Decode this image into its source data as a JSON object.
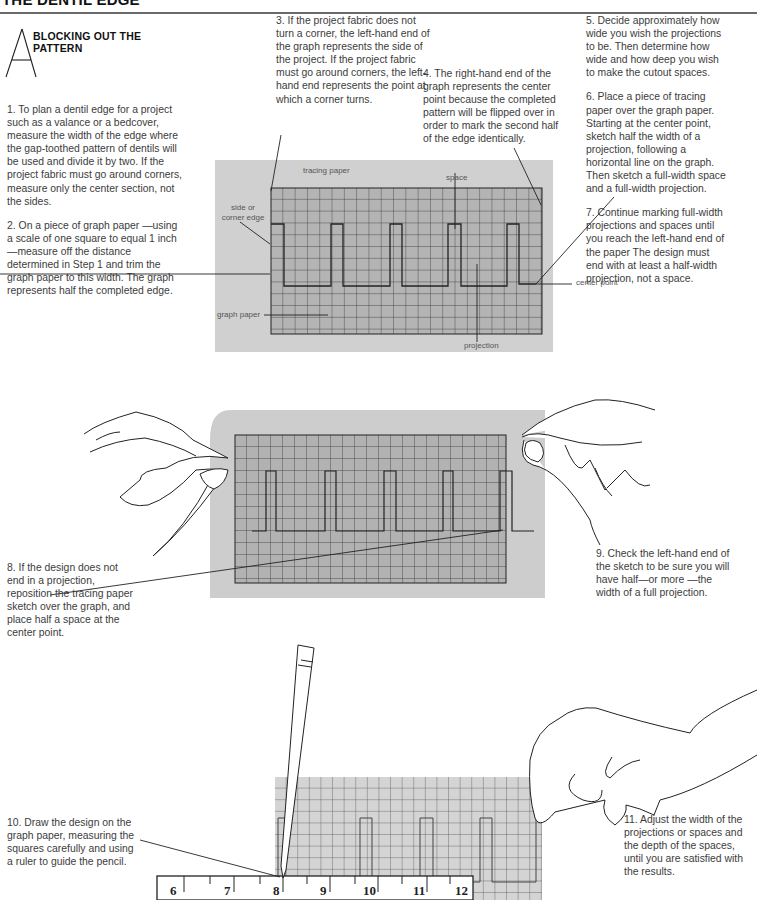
{
  "header": {
    "title": "THE DENTIL EDGE",
    "section_heading": "BLOCKING OUT THE PATTERN",
    "drop_cap": "A"
  },
  "steps": [
    {
      "n": 1,
      "text": "1. To plan a dentil edge for a project such as a valance or a bedcover, measure the width of the edge where the gap-toothed pattern of dentils will be used and divide it by two. If the project fabric must go around corners, measure only the center section, not the sides."
    },
    {
      "n": 2,
      "text": "2. On a piece of graph paper —using a scale of one square to equal 1 inch —measure off the distance determined in Step 1 and trim the graph paper to this width. The graph represents half the completed edge."
    },
    {
      "n": 3,
      "text": "3. If the project fabric does not turn a corner, the left-hand end of the graph represents the side of the project. If the project fabric must go around corners, the left-hand end represents the point at which a corner turns."
    },
    {
      "n": 4,
      "text": "4. The right-hand end of the graph represents the center point because the completed pattern will be flipped over in order to mark the second half of the edge identically."
    },
    {
      "n": 5,
      "text": "5. Decide approximately how wide you wish the projections to be. Then determine how wide and how deep you wish to make the cutout spaces."
    },
    {
      "n": 6,
      "text": "6. Place a piece of tracing paper over the graph paper. Starting at the center point, sketch half the width of a projection, following a horizontal line on the graph. Then sketch a full-width space and a full-width projection."
    },
    {
      "n": 7,
      "text": "7. Continue marking full-width projections and spaces until you reach the left-hand end of the paper The design must end with at least a half-width projection, not a space."
    },
    {
      "n": 8,
      "text": "8. If the design does not end in a projection, reposition the tracing paper sketch over the graph, and place half a space at the center point."
    },
    {
      "n": 9,
      "text": "9. Check the left-hand end of the sketch to be sure you will have half—or more —the width of a full projection."
    },
    {
      "n": 10,
      "text": "10. Draw the design on the graph paper, measuring the squares carefully and using a ruler to guide the pencil."
    },
    {
      "n": 11,
      "text": "11. Adjust the width of the projections or spaces and the depth of the spaces, until you are satisfied with the results."
    }
  ],
  "diagram_labels": {
    "tracing_paper": "tracing paper",
    "space": "space",
    "side_or_corner_edge_1": "side or",
    "side_or_corner_edge_2": "corner edge",
    "center_point": "center point",
    "graph_paper": "graph paper",
    "projection": "projection"
  },
  "ruler": {
    "numbers": [
      "6",
      "7",
      "8",
      "9",
      "10",
      "11",
      "12"
    ]
  },
  "colors": {
    "tracing_paper": "#cfcfcf",
    "graph_paper": "#b4b4b4",
    "bottom_graph": "#d2d2d2",
    "line": "#222222"
  }
}
